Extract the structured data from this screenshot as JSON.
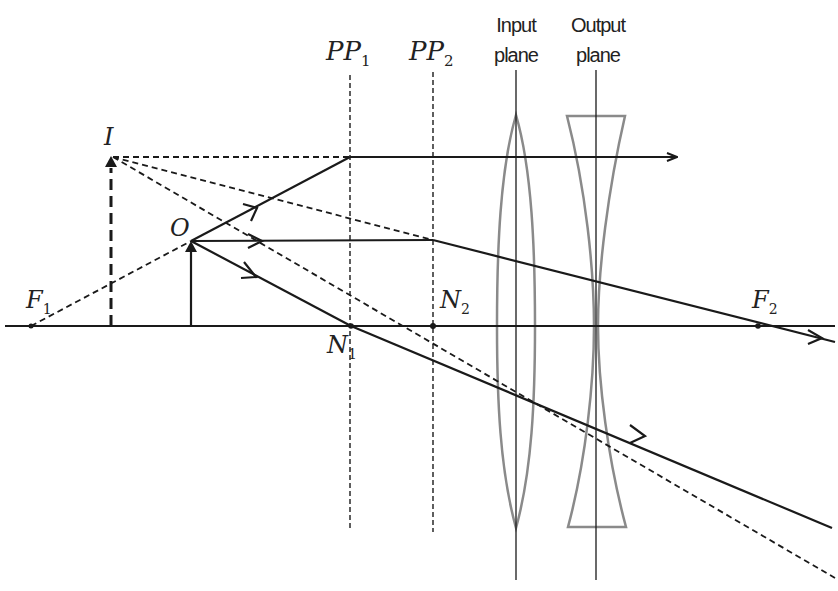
{
  "diagram": {
    "title": "",
    "colors": {
      "ink": "#1a1a1a",
      "lens": "#8a8a8a",
      "background": "#ffffff"
    },
    "labels": {
      "pp1": {
        "main": "PP",
        "sub": "1"
      },
      "pp2": {
        "main": "PP",
        "sub": "2"
      },
      "input_plane": {
        "line1": "Input",
        "line2": "plane"
      },
      "output_plane": {
        "line1": "Output",
        "line2": "plane"
      },
      "image": {
        "main": "I"
      },
      "object": {
        "main": "O"
      },
      "f1": {
        "main": "F",
        "sub": "1"
      },
      "f2": {
        "main": "F",
        "sub": "2"
      },
      "n1": {
        "main": "N",
        "sub": "1"
      },
      "n2": {
        "main": "N",
        "sub": "2"
      }
    },
    "elements": [
      {
        "id": "optical-axis",
        "type": "axis",
        "description": "Horizontal optical axis with arrow at right end"
      },
      {
        "id": "pp1",
        "type": "principal-plane",
        "style": "dashed"
      },
      {
        "id": "pp2",
        "type": "principal-plane",
        "style": "dashed"
      },
      {
        "id": "input-plane",
        "type": "reference-plane",
        "style": "solid thin"
      },
      {
        "id": "output-plane",
        "type": "reference-plane",
        "style": "solid thin"
      },
      {
        "id": "convex-lens",
        "type": "lens",
        "kind": "converging"
      },
      {
        "id": "concave-lens",
        "type": "lens",
        "kind": "diverging"
      },
      {
        "id": "object-arrow",
        "type": "object",
        "label": "O"
      },
      {
        "id": "image-arrow",
        "type": "virtual-image",
        "label": "I",
        "style": "dashed"
      },
      {
        "id": "ray-focal",
        "type": "ray",
        "description": "Ray from O directed away from F1, refracts at PP1 to go parallel"
      },
      {
        "id": "ray-parallel",
        "type": "ray",
        "description": "Ray from O parallel to axis, refracts at PP2 through F2"
      },
      {
        "id": "ray-nodal",
        "type": "ray",
        "description": "Ray from O through N1, exits parallel from N2"
      }
    ]
  }
}
